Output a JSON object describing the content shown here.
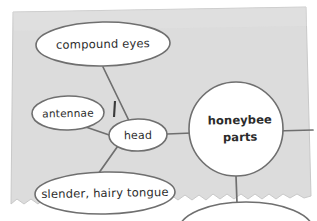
{
  "diagram": {
    "type": "concept-map",
    "title": "honeybee parts",
    "background_color": "#ffffff",
    "paper_color": "#dcdcdc",
    "node_fill": "#ffffff",
    "stroke_color": "#6e6e6e",
    "text_color": "#2b2b2b",
    "center_node": {
      "id": "honeybee-parts",
      "line1": "honeybee",
      "line2": "parts",
      "shape": "circle",
      "bold": true
    },
    "nodes": [
      {
        "id": "compound-eyes",
        "label": "compound eyes",
        "shape": "ellipse"
      },
      {
        "id": "antennae",
        "label": "antennae",
        "shape": "ellipse"
      },
      {
        "id": "head",
        "label": "head",
        "shape": "ellipse"
      },
      {
        "id": "slender-hairy-tongue",
        "label": "slender, hairy tongue",
        "shape": "ellipse"
      }
    ],
    "marks": [
      {
        "id": "tick-mark",
        "label": "I",
        "shape": "short-vertical-stroke"
      }
    ],
    "edges": [
      {
        "from": "head",
        "to": "compound-eyes"
      },
      {
        "from": "head",
        "to": "antennae"
      },
      {
        "from": "head",
        "to": "slender-hairy-tongue"
      },
      {
        "from": "head",
        "to": "honeybee-parts"
      },
      {
        "from": "honeybee-parts",
        "to": "off-screen-right"
      },
      {
        "from": "honeybee-parts",
        "to": "off-screen-bottom"
      }
    ]
  }
}
